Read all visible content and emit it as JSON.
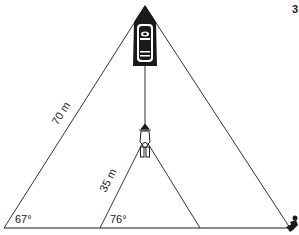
{
  "figure": {
    "number": "3",
    "labels": {
      "long_side": "70 m",
      "short_side": "35 m",
      "angle_large": "67°",
      "angle_small": "76°"
    },
    "elements": {
      "boat": "boat-topview",
      "diver": "diver-figure",
      "swimmer": "swimmer-figure"
    },
    "colors": {
      "ink": "#1a1a1a",
      "background": "#ffffff"
    }
  }
}
